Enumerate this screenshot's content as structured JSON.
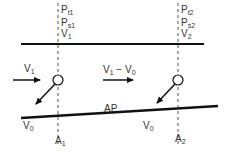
{
  "diagram": {
    "title": "",
    "colors": {
      "line": "#111111",
      "text": "#333333",
      "dashed": "#444444"
    },
    "section1": {
      "labels": [
        {
          "base": "P",
          "sub": "t1"
        },
        {
          "base": "P",
          "sub": "s1"
        },
        {
          "base": "V",
          "sub": "1"
        }
      ],
      "axis_label": {
        "base": "A",
        "sub": "1"
      },
      "inlet_velocity": {
        "base": "V",
        "sub": "1"
      },
      "bottom_velocity": {
        "base": "V",
        "sub": "0"
      }
    },
    "section2": {
      "labels": [
        {
          "base": "P",
          "sub": "t2"
        },
        {
          "base": "P",
          "sub": "s2"
        },
        {
          "base": "V",
          "sub": "2"
        }
      ],
      "axis_label": {
        "base": "A",
        "sub": "2"
      },
      "relative_velocity": {
        "base": "V",
        "sub1": "1",
        "minus": " − ",
        "base2": "V",
        "sub2": "0"
      },
      "bottom_velocity": {
        "base": "V",
        "sub": "0"
      }
    },
    "plate_label": "AP"
  }
}
